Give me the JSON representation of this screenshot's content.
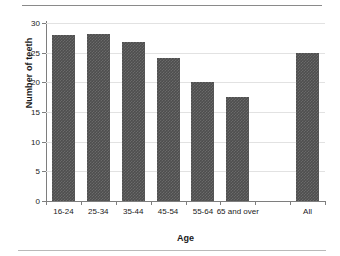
{
  "chart_data": {
    "type": "bar",
    "title": "",
    "xlabel": "Age",
    "ylabel": "Number of teeth",
    "categories": [
      "16-24",
      "25-34",
      "35-44",
      "45-54",
      "55-64",
      "65 and over",
      "",
      "All"
    ],
    "values": [
      27.9,
      28.1,
      26.8,
      24.1,
      20.0,
      17.6,
      null,
      25.0
    ],
    "ylim": [
      0,
      30
    ],
    "yticks": [
      0,
      5,
      10,
      15,
      20,
      25,
      30
    ],
    "ytick_labels": [
      "0",
      "5",
      "10",
      "15",
      "20",
      "25",
      "30"
    ],
    "grid": true,
    "legend": false,
    "bar_color": "#4e4e4e",
    "axis_color": "#7e7e7e",
    "gridline_color": "#e2e2e2"
  },
  "figure": {
    "background_color": "#ffffff",
    "text_color": "#1a1a1a"
  }
}
